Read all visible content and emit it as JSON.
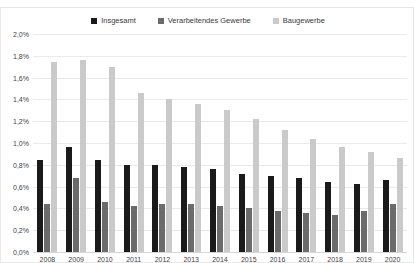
{
  "top_crop_text": "·  ·      ·   ·      ·                    ·             ·     ·",
  "legend": {
    "items": [
      {
        "label": "Insgesamt",
        "color": "#1a1a1a",
        "swatch_name": "legend-swatch-insgesamt"
      },
      {
        "label": "Verarbeitendes Gewerbe",
        "color": "#6b6b6b",
        "swatch_name": "legend-swatch-verarbeitendes-gewerbe"
      },
      {
        "label": "Baugewerbe",
        "color": "#cacaca",
        "swatch_name": "legend-swatch-baugewerbe"
      }
    ]
  },
  "chart_data": {
    "type": "bar",
    "title": "",
    "xlabel": "",
    "ylabel": "",
    "ylim": [
      0,
      2.0
    ],
    "ytick_labels": [
      "2,0%",
      "1,8%",
      "1,6%",
      "1,4%",
      "1,2%",
      "1,0%",
      "0,8%",
      "0,6%",
      "0,4%",
      "0,2%",
      "0,0%"
    ],
    "ytick_values": [
      2.0,
      1.8,
      1.6,
      1.4,
      1.2,
      1.0,
      0.8,
      0.6,
      0.4,
      0.2,
      0.0
    ],
    "grid": true,
    "legend_position": "top-center",
    "value_suffix": "%",
    "categories": [
      "2008",
      "2009",
      "2010",
      "2011",
      "2012",
      "2013",
      "2014",
      "2015",
      "2016",
      "2017",
      "2018",
      "2019",
      "2020"
    ],
    "series": [
      {
        "name": "Insgesamt",
        "color": "#1a1a1a",
        "values": [
          0.84,
          0.96,
          0.84,
          0.8,
          0.8,
          0.78,
          0.76,
          0.72,
          0.7,
          0.68,
          0.64,
          0.62,
          0.66
        ]
      },
      {
        "name": "Verarbeitendes Gewerbe",
        "color": "#6b6b6b",
        "values": [
          0.44,
          0.68,
          0.46,
          0.42,
          0.44,
          0.44,
          0.42,
          0.4,
          0.38,
          0.36,
          0.34,
          0.38,
          0.44
        ]
      },
      {
        "name": "Baugewerbe",
        "color": "#cacaca",
        "values": [
          1.74,
          1.76,
          1.7,
          1.46,
          1.4,
          1.36,
          1.3,
          1.22,
          1.12,
          1.04,
          0.96,
          0.92,
          0.86
        ]
      }
    ]
  }
}
